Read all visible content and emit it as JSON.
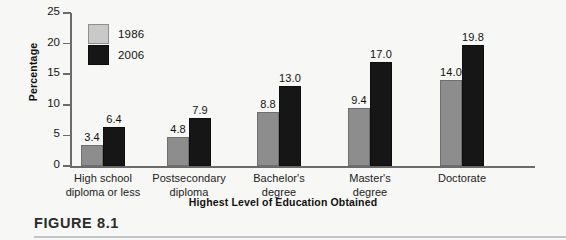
{
  "chart_data": {
    "type": "bar",
    "title": "",
    "xlabel": "Highest Level of Education Obtained",
    "ylabel": "Percentage",
    "ylim": [
      0,
      25
    ],
    "yticks": [
      0,
      5,
      10,
      15,
      20,
      25
    ],
    "ytick_labels": [
      "0",
      "5",
      "10",
      "15",
      "20",
      "25"
    ],
    "grid": false,
    "legend_position": "upper left",
    "categories": [
      "High school\ndiploma or less",
      "Postsecondary\ndiploma",
      "Bachelor's\ndegree",
      "Master's\ndegree",
      "Doctorate"
    ],
    "series": [
      {
        "name": "1986",
        "color": "#8d8d8d",
        "values": [
          3.4,
          4.8,
          8.8,
          9.4,
          14.0
        ],
        "value_labels": [
          "3.4",
          "4.8",
          "8.8",
          "9.4",
          "14.0"
        ]
      },
      {
        "name": "2006",
        "color": "#161616",
        "values": [
          6.4,
          7.9,
          13.0,
          17.0,
          19.8
        ],
        "value_labels": [
          "6.4",
          "7.9",
          "13.0",
          "17.0",
          "19.8"
        ]
      }
    ]
  },
  "legend": {
    "items": [
      {
        "label": "1986",
        "swatch": "light-gray-square"
      },
      {
        "label": "2006",
        "swatch": "black-square"
      }
    ]
  },
  "caption": {
    "figure_label": "FIGURE 8.1"
  },
  "colors": {
    "series_1986": "#8d8d8d",
    "series_2006": "#161616",
    "axis": "#6b6b6b",
    "page_background": "#f7f7f5",
    "caption_rule": "#c2c6cb"
  }
}
